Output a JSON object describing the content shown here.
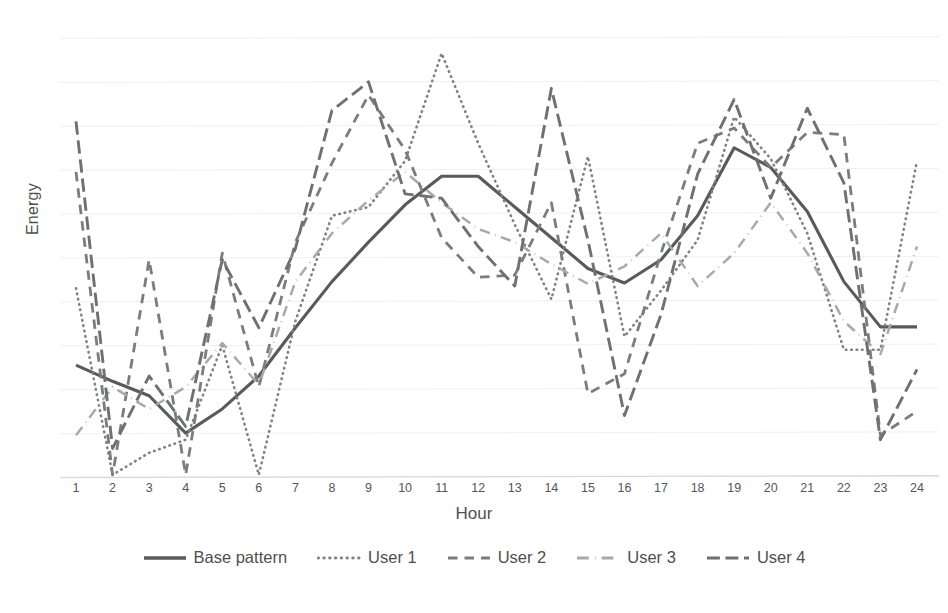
{
  "chart_data": {
    "type": "line",
    "title": "",
    "xlabel": "Hour",
    "ylabel": "Energy",
    "x": [
      1,
      2,
      3,
      4,
      5,
      6,
      7,
      8,
      9,
      10,
      11,
      12,
      13,
      14,
      15,
      16,
      17,
      18,
      19,
      20,
      21,
      22,
      23,
      24
    ],
    "xtick_labels": [
      "1",
      "2",
      "3",
      "4",
      "5",
      "6",
      "7",
      "8",
      "9",
      "10",
      "11",
      "12",
      "13",
      "14",
      "15",
      "16",
      "17",
      "18",
      "19",
      "20",
      "21",
      "22",
      "23",
      "24"
    ],
    "ylim": [
      0,
      10
    ],
    "ytick_labels": [],
    "grid": "horizontal",
    "gridlines": 10,
    "legend_position": "bottom",
    "series": [
      {
        "name": "Base pattern",
        "style": "solid",
        "color": "#595a5c",
        "width": 3.1,
        "values": [
          2.55,
          2.18,
          1.85,
          1.0,
          1.55,
          2.3,
          3.4,
          4.45,
          5.35,
          6.2,
          6.85,
          6.85,
          6.15,
          5.45,
          4.75,
          4.42,
          4.95,
          5.95,
          7.5,
          7.05,
          6.05,
          4.45,
          3.42,
          3.42
        ]
      },
      {
        "name": "User 1",
        "style": "dotted",
        "color": "#808285",
        "width": 2.6,
        "values": [
          4.3,
          0.05,
          0.55,
          0.85,
          3.0,
          0.05,
          3.55,
          5.95,
          6.15,
          7.2,
          9.65,
          7.6,
          5.75,
          4.05,
          7.3,
          3.2,
          4.25,
          5.4,
          8.2,
          7.25,
          5.55,
          2.9,
          2.9,
          7.2
        ]
      },
      {
        "name": "User 2",
        "style": "dashed",
        "color": "#7a7c7f",
        "width": 2.8,
        "values": [
          6.95,
          0.05,
          4.95,
          0.05,
          5.1,
          2.05,
          5.35,
          7.15,
          8.7,
          7.45,
          5.45,
          4.55,
          4.6,
          6.25,
          1.9,
          2.35,
          5.1,
          7.6,
          7.95,
          7.05,
          7.85,
          7.8,
          0.95,
          1.5
        ]
      },
      {
        "name": "User 3",
        "style": "dashdot",
        "color": "#a8a9ab",
        "width": 2.5,
        "values": [
          0.95,
          2.05,
          1.55,
          2.05,
          3.05,
          2.1,
          4.45,
          5.55,
          6.3,
          6.95,
          6.25,
          5.65,
          5.35,
          4.85,
          4.4,
          4.8,
          5.55,
          4.35,
          5.1,
          6.25,
          5.1,
          3.55,
          2.8,
          5.25
        ]
      },
      {
        "name": "User 4",
        "style": "longdash",
        "color": "#6e7073",
        "width": 2.9,
        "values": [
          8.1,
          0.65,
          2.3,
          1.15,
          4.95,
          3.4,
          5.2,
          8.35,
          9.0,
          6.45,
          6.35,
          5.25,
          4.35,
          8.85,
          5.4,
          1.4,
          3.7,
          6.9,
          8.6,
          6.35,
          8.4,
          6.7,
          0.85,
          2.45
        ]
      }
    ]
  },
  "axes": {
    "y_title": "Energy",
    "x_title": "Hour"
  },
  "legend": {
    "items": [
      {
        "label": "Base pattern",
        "style": "solid",
        "color": "#595a5c"
      },
      {
        "label": "User 1",
        "style": "dotted",
        "color": "#808285"
      },
      {
        "label": "User 2",
        "style": "dashed",
        "color": "#7a7c7f"
      },
      {
        "label": "User 3",
        "style": "dashdot",
        "color": "#a8a9ab"
      },
      {
        "label": "User 4",
        "style": "longdash",
        "color": "#6e7073"
      }
    ]
  },
  "style": {
    "grid_color": "#f0f0f0",
    "axis_color": "#d9d9d9",
    "text_color": "#4f4f4f",
    "background": "#ffffff"
  }
}
